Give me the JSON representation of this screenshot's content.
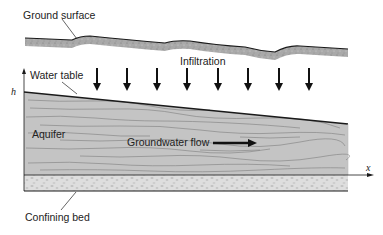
{
  "diagram": {
    "type": "cross-section",
    "labels": {
      "ground_surface": "Ground surface",
      "infiltration": "Infiltration",
      "water_table": "Water table",
      "aquifer": "Aquifer",
      "groundwater_flow": "Groundwater flow",
      "confining_bed": "Confining bed"
    },
    "axes": {
      "vertical": "h",
      "horizontal": "x"
    },
    "infiltration_arrow_count": 8,
    "colors": {
      "ground_surface_fill": "#a8a8a8",
      "aquifer_fill": "#c4c4c4",
      "confining_bed_fill": "#dcdcdc",
      "line": "#1a1a1a",
      "background": "#ffffff"
    }
  }
}
